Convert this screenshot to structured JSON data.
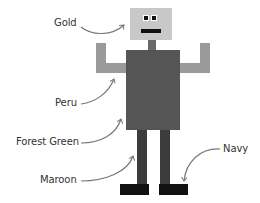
{
  "labels": {
    "gold": "Gold",
    "peru": "Peru",
    "forest_green": "Forest Green",
    "maroon": "Maroon",
    "navy": "Navy"
  },
  "parts": {
    "head": {
      "name": "head",
      "color": "#c8c8c8"
    },
    "eyes": {
      "white": "#ffffff",
      "pupil": "#111111"
    },
    "mouth": {
      "color": "#111111"
    },
    "neck": {
      "color": "#6a6a6a"
    },
    "arms": {
      "color": "#9a9a9a"
    },
    "body": {
      "color": "#555555"
    },
    "legs": {
      "color": "#3c3c3c"
    },
    "feet": {
      "color": "#111111"
    }
  },
  "arrow_color": "#777777"
}
